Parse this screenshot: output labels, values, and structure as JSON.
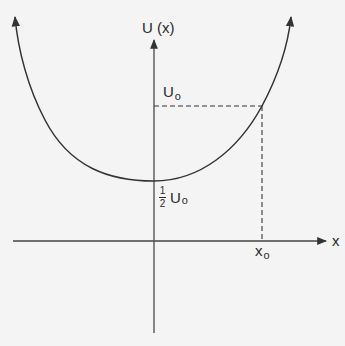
{
  "diagram": {
    "type": "potential-energy-curve",
    "y_axis_label": "U (x)",
    "x_axis_label": "x",
    "level_label": {
      "main": "U",
      "sub": "o"
    },
    "minimum_label": {
      "num": "1",
      "den": "2",
      "main": "U",
      "sub": "o"
    },
    "position_label": {
      "main": "x",
      "sub": "o"
    },
    "colors": {
      "line": "#333333",
      "axis": "#444444",
      "background": "#f4f4f4"
    },
    "annotations": [
      {
        "id": "U0-level",
        "style": "dashed",
        "description": "horizontal dashed line from U axis at U0 to curve"
      },
      {
        "id": "x0-drop",
        "style": "dashed",
        "description": "vertical dashed line from curve down to x axis at x0"
      },
      {
        "id": "minimum",
        "description": "curve minimum at x = 0 equals 1/2 U0"
      }
    ]
  }
}
